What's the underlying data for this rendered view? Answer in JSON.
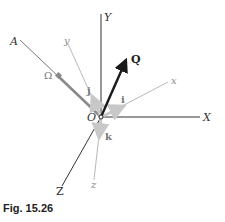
{
  "figure": {
    "caption": "Fig. 15.26",
    "origin_label": "O",
    "fixed_axes": {
      "X": "X",
      "Y": "Y",
      "Z": "Z"
    },
    "rotating_axes": {
      "x": "x",
      "y": "y",
      "z": "z"
    },
    "unit_vectors": {
      "i": "i",
      "j": "j",
      "k": "k"
    },
    "axis_A_label": "A",
    "angular_velocity_label": "Ω",
    "vector_label": "Q",
    "colors": {
      "fixed_axis": "#333333",
      "rotating_axis": "#9a9a9a",
      "unit_vector": "#c8c8c8",
      "omega_vector": "#8a8a8a",
      "Q_vector": "#1a1a1a"
    }
  }
}
